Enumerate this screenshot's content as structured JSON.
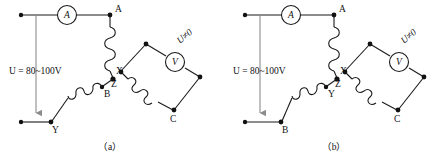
{
  "figure": {
    "panels": [
      {
        "id": "a",
        "caption": "（a）",
        "source_label": "U = 80~100V",
        "ammeter_symbol": "A",
        "voltmeter_symbol": "V",
        "voltmeter_annotation": "U≠0",
        "node_labels": {
          "phase_a": "A",
          "winding_x": "X",
          "phase_b": "B",
          "winding_y": "Y",
          "winding_z": "Z",
          "phase_c": "C"
        }
      },
      {
        "id": "b",
        "caption": "（b）",
        "source_label": "U = 80~100V",
        "ammeter_symbol": "A",
        "voltmeter_symbol": "V",
        "voltmeter_annotation": "U≠0",
        "node_labels": {
          "phase_a": "A",
          "winding_x": "X",
          "winding_y": "Y",
          "phase_b": "B",
          "winding_z": "Z",
          "phase_c": "C"
        }
      }
    ],
    "colors": {
      "wire": "#1a1a1a",
      "wire_light": "#8c8c8c",
      "node": "#111111",
      "background": "#ffffff"
    }
  }
}
